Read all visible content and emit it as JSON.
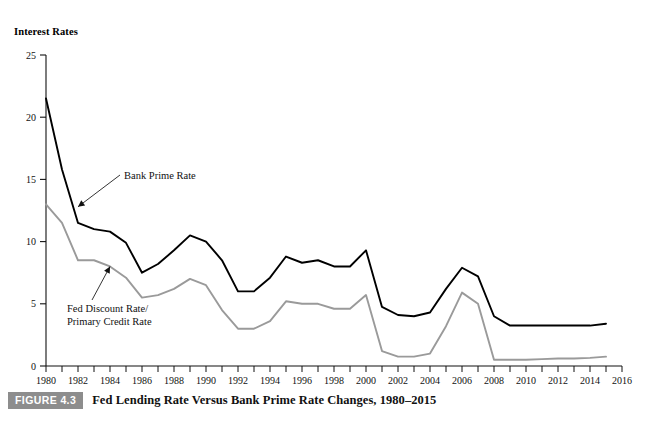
{
  "figure": {
    "caption_tag": "FIGURE 4.3",
    "caption_text": "Fed Lending Rate Versus Bank Prime Rate Changes, 1980–2015",
    "y_axis_title": "Interest Rates"
  },
  "chart_data": {
    "type": "line",
    "title": "Fed Lending Rate Versus Bank Prime Rate Changes, 1980–2015",
    "xlabel": "",
    "ylabel": "Interest Rates",
    "xlim": [
      1980,
      2016
    ],
    "ylim": [
      0,
      25
    ],
    "yticks": [
      0,
      5,
      10,
      15,
      20,
      25
    ],
    "ytick_labels": [
      "0",
      "5",
      "10",
      "15",
      "20",
      "25"
    ],
    "xticks": [
      1980,
      1981,
      1982,
      1983,
      1984,
      1985,
      1986,
      1987,
      1988,
      1989,
      1990,
      1991,
      1992,
      1993,
      1994,
      1995,
      1996,
      1997,
      1998,
      1999,
      2000,
      2001,
      2002,
      2003,
      2004,
      2005,
      2006,
      2007,
      2008,
      2009,
      2010,
      2011,
      2012,
      2013,
      2014,
      2015,
      2016
    ],
    "xtick_labels_shown": [
      "1980",
      "1982",
      "1984",
      "1986",
      "1988",
      "1990",
      "1992",
      "1994",
      "1996",
      "1998",
      "2000",
      "2002",
      "2004",
      "2006",
      "2008",
      "2010",
      "2012",
      "2014",
      "2016"
    ],
    "grid": false,
    "legend_position": "inline-annotations",
    "x": [
      1980,
      1981,
      1982,
      1983,
      1984,
      1985,
      1986,
      1987,
      1988,
      1989,
      1990,
      1991,
      1992,
      1993,
      1994,
      1995,
      1996,
      1997,
      1998,
      1999,
      2000,
      2001,
      2002,
      2003,
      2004,
      2005,
      2006,
      2007,
      2008,
      2009,
      2010,
      2011,
      2012,
      2013,
      2014,
      2015
    ],
    "series": [
      {
        "name": "Bank Prime Rate",
        "color": "#000000",
        "values": [
          21.5,
          15.8,
          11.5,
          11.0,
          10.8,
          9.9,
          7.5,
          8.2,
          9.3,
          10.5,
          10.0,
          8.5,
          6.0,
          6.0,
          7.1,
          8.8,
          8.3,
          8.5,
          8.0,
          8.0,
          9.3,
          4.75,
          4.1,
          4.0,
          4.3,
          6.2,
          7.9,
          7.2,
          4.0,
          3.25,
          3.25,
          3.25,
          3.25,
          3.25,
          3.25,
          3.4
        ]
      },
      {
        "name": "Fed Discount Rate/Primary Credit Rate",
        "color": "#9a9a9a",
        "values": [
          13.0,
          11.5,
          8.5,
          8.5,
          8.0,
          7.1,
          5.5,
          5.7,
          6.2,
          7.0,
          6.5,
          4.5,
          3.0,
          3.0,
          3.6,
          5.2,
          5.0,
          5.0,
          4.6,
          4.6,
          5.7,
          1.2,
          0.75,
          0.75,
          1.0,
          3.2,
          5.9,
          5.0,
          0.5,
          0.5,
          0.5,
          0.55,
          0.6,
          0.6,
          0.65,
          0.75
        ]
      }
    ],
    "annotations": [
      {
        "text": "Bank Prime Rate",
        "target_x": 1982,
        "target_y": 12.8
      },
      {
        "text_line1": "Fed Discount Rate/",
        "text_line2": "Primary Credit Rate",
        "target_x": 1984,
        "target_y": 8.0
      }
    ]
  }
}
